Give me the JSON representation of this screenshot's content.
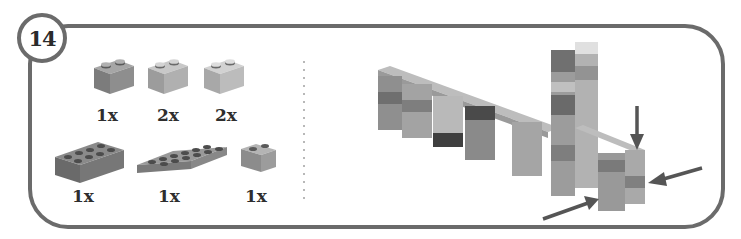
{
  "step": {
    "number": "14"
  },
  "parts_list": {
    "items": [
      {
        "name": "brick-1x2",
        "quantity": "1x",
        "color": "#8a8a8a"
      },
      {
        "name": "brick-1x2",
        "quantity": "2x",
        "color": "#a8a8a8"
      },
      {
        "name": "brick-1x2",
        "quantity": "2x",
        "color": "#b4b4b4"
      },
      {
        "name": "brick-2x4",
        "quantity": "1x",
        "color": "#7a7a7a"
      },
      {
        "name": "plate-2x6",
        "quantity": "1x",
        "color": "#8c8c8c"
      },
      {
        "name": "brick-1x2",
        "quantity": "1x",
        "color": "#9a9a9a"
      }
    ]
  },
  "assembly": {
    "arrows": [
      {
        "name": "arrow-down",
        "direction": "down"
      },
      {
        "name": "arrow-left",
        "direction": "left"
      },
      {
        "name": "arrow-up-right",
        "direction": "up-right"
      }
    ]
  },
  "colors": {
    "frame": "#6b6b6b",
    "text": "#2e2e2e",
    "arrow": "#555555"
  }
}
